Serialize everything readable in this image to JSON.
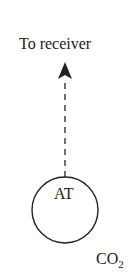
{
  "diagram": {
    "arrow_label": "To receiver",
    "node_label": "AT",
    "gas_label_main": "CO",
    "gas_label_sub": "2",
    "arrow_style": "dashed",
    "line_color": "#222222"
  }
}
